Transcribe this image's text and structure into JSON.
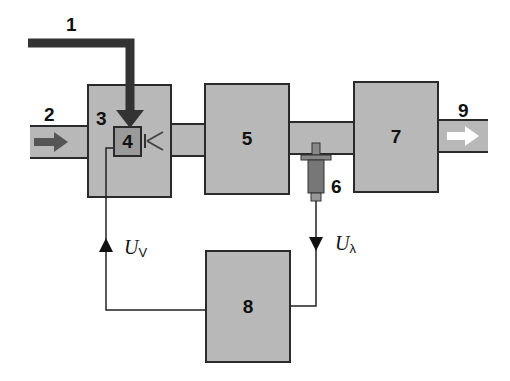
{
  "diagram": {
    "colors": {
      "block_fill": "#b8b8b8",
      "inner_fill": "#999999",
      "line": "#2a2a2a",
      "arrow_dark": "#555555",
      "arrow_light": "#ffffff"
    },
    "labels": {
      "l1": "1",
      "l2": "2",
      "l3": "3",
      "l4": "4",
      "l5": "5",
      "l6": "6",
      "l7": "7",
      "l8": "8",
      "l9": "9"
    },
    "signals": {
      "uv_main": "U",
      "uv_sub": "V",
      "ul_main": "U",
      "ul_sub": "λ"
    }
  }
}
